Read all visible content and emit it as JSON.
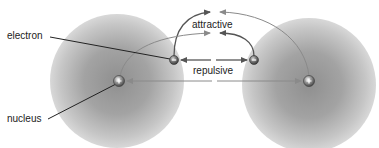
{
  "diagram": {
    "labels": {
      "electron": "electron",
      "nucleus": "nucleus",
      "attractive": "attractive",
      "repulsive": "repulsive"
    },
    "particles": {
      "nucleus_symbol": "+",
      "electron_symbol": "−"
    },
    "colors": {
      "electron_cloud": "#9a9a9a",
      "arrow_dark": "#555555",
      "arrow_light": "#8a8a8a",
      "leader_line": "#222222",
      "background": "#ffffff"
    },
    "forces": [
      {
        "type": "attractive",
        "from": "left-electron",
        "to": "right-nucleus"
      },
      {
        "type": "attractive",
        "from": "right-electron",
        "to": "left-nucleus"
      },
      {
        "type": "repulsive",
        "between": [
          "left-electron",
          "right-electron"
        ]
      },
      {
        "type": "repulsive",
        "between": [
          "left-nucleus",
          "right-nucleus"
        ]
      }
    ]
  }
}
